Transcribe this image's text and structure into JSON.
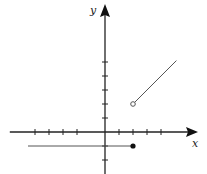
{
  "chart_data": {
    "type": "line",
    "title": "",
    "xlabel": "x",
    "ylabel": "y",
    "grid": false,
    "tick_spacing": 1,
    "x_ticks": [
      -5,
      -4,
      -3,
      -2,
      1,
      2,
      3,
      4
    ],
    "y_ticks": [
      -2,
      -1,
      1,
      2,
      3,
      4,
      5
    ],
    "xlim": [
      -6.8,
      6.7
    ],
    "ylim": [
      -3,
      9.4
    ],
    "series": [
      {
        "name": "piece-1",
        "description": "y = -1 for x <= 2",
        "points": [
          [
            -5.5,
            -1
          ],
          [
            2,
            -1
          ]
        ],
        "left_endpoint": "none",
        "right_endpoint": "closed"
      },
      {
        "name": "piece-2",
        "description": "y = x for x > 2",
        "points": [
          [
            2,
            2
          ],
          [
            5.1,
            5.1
          ]
        ],
        "left_endpoint": "open",
        "right_endpoint": "none"
      }
    ]
  },
  "labels": {
    "x": "x",
    "y": "y"
  },
  "colors": {
    "axis": "#222222",
    "line": "#555555",
    "dot": "#111111"
  },
  "layout": {
    "origin_px": [
      105,
      132
    ],
    "unit_px": 14
  }
}
